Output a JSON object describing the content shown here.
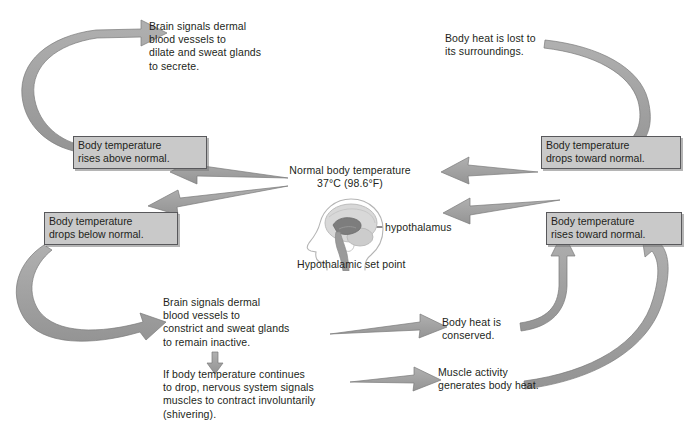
{
  "diagram": {
    "center": {
      "normal_temp_line1": "Normal body temperature",
      "normal_temp_line2": "37°C (98.6°F)",
      "set_point_label": "Hypothalamic set point",
      "hypothalamus_label": "hypothalamus",
      "figure_name": "head-profile-with-brain"
    },
    "state_boxes": [
      {
        "id": "rises-above-normal",
        "text": "Body temperature\nrises above normal."
      },
      {
        "id": "drops-toward-normal",
        "text": "Body temperature\ndrops toward normal."
      },
      {
        "id": "drops-below-normal",
        "text": "Body temperature\ndrops below normal."
      },
      {
        "id": "rises-toward-normal",
        "text": "Body temperature\nrises toward normal."
      }
    ],
    "steps": [
      {
        "id": "dilate-sweat",
        "text": "Brain signals dermal\nblood vessels to\ndilate and sweat glands\nto secrete."
      },
      {
        "id": "heat-lost",
        "text": "Body heat is lost to\nits surroundings."
      },
      {
        "id": "constrict-no-sweat",
        "text": "Brain signals dermal\nblood vessels to\nconstrict and sweat glands\nto remain inactive."
      },
      {
        "id": "heat-conserved",
        "text": "Body heat is\nconserved."
      },
      {
        "id": "shivering",
        "text": "If body temperature continues\nto drop, nervous system signals\nmuscles to contract involuntarily\n(shivering)."
      },
      {
        "id": "muscle-activity",
        "text": "Muscle activity\ngenerates body heat."
      }
    ],
    "colors": {
      "arrow_fill": "#9b9b9b",
      "arrow_stroke": "#7c7c7c",
      "box_fill": "#c9c9c9",
      "box_border": "#58585b",
      "text": "#231f20",
      "head_outline": "#a8a8a8",
      "brain_fill": "#b9b9b9",
      "hypothalamus_fill": "#6e6e6e"
    }
  }
}
